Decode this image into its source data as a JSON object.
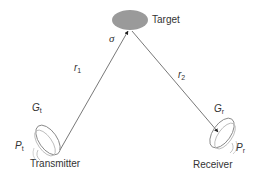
{
  "diagram": {
    "target": {
      "label": "Target",
      "cross_section": "σ",
      "fill": "#9a9a9a"
    },
    "paths": [
      {
        "name": "r",
        "sub": "1"
      },
      {
        "name": "r",
        "sub": "2"
      }
    ],
    "transmitter": {
      "label": "Transmitter",
      "gain": {
        "name": "G",
        "sub": "t"
      },
      "power": {
        "name": "P",
        "sub": "t"
      }
    },
    "receiver": {
      "label": "Receiver",
      "gain": {
        "name": "G",
        "sub": "r"
      },
      "power": {
        "name": "P",
        "sub": "r"
      }
    },
    "colors": {
      "line": "#555555",
      "dish": "#888888",
      "text": "#333333"
    }
  }
}
